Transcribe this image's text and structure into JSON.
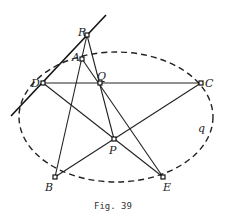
{
  "figure": {
    "caption": "Fig. 39",
    "curve_label": "q"
  },
  "points": {
    "R": {
      "label": "R",
      "x": 87,
      "y": 35
    },
    "A": {
      "label": "A",
      "x": 82,
      "y": 59
    },
    "D": {
      "label": "D",
      "x": 43,
      "y": 83
    },
    "Q": {
      "label": "Q",
      "x": 100,
      "y": 83
    },
    "C": {
      "label": "C",
      "x": 201,
      "y": 83
    },
    "P": {
      "label": "P",
      "x": 114,
      "y": 139
    },
    "B": {
      "label": "B",
      "x": 55,
      "y": 177
    },
    "E": {
      "label": "E",
      "x": 163,
      "y": 177
    }
  },
  "ellipse": {
    "cx": 116,
    "cy": 117,
    "rx": 97,
    "ry": 65,
    "style": "dashed"
  },
  "tangent_line": {
    "x1": 11,
    "y1": 116,
    "x2": 106,
    "y2": 15
  },
  "segments": [
    [
      "D",
      "C"
    ],
    [
      "D",
      "E"
    ],
    [
      "B",
      "C"
    ],
    [
      "B",
      "R"
    ],
    [
      "R",
      "P"
    ],
    [
      "A",
      "E"
    ]
  ]
}
